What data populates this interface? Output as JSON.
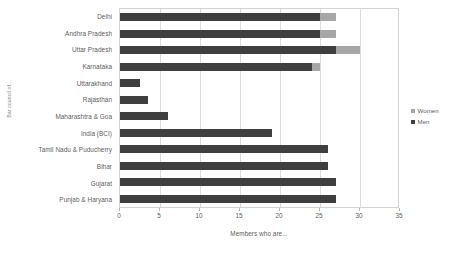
{
  "chart_data": {
    "type": "bar",
    "orientation": "horizontal",
    "stacked": true,
    "title": "",
    "xlabel": "Members who are...",
    "ylabel": "Bar council of...",
    "xlim": [
      0,
      35
    ],
    "xticks": [
      0,
      5,
      10,
      15,
      20,
      25,
      30,
      35
    ],
    "grid": true,
    "legend_position": "right",
    "categories": [
      "Delhi",
      "Andhra Pradesh",
      "Uttar Pradesh",
      "Karnataka",
      "Uttarakhand",
      "Rajasthan",
      "Maharashtra & Goa",
      "India (BCI)",
      "Tamil Nadu & Puducherry",
      "Bihar",
      "Gujarat",
      "Punjab & Haryana"
    ],
    "series": [
      {
        "name": "Men",
        "color": "#3f3f3f",
        "values": [
          25,
          25,
          27,
          24,
          2.5,
          3.5,
          6,
          19,
          26,
          26,
          27,
          27
        ]
      },
      {
        "name": "Women",
        "color": "#a6a6a6",
        "values": [
          2,
          2,
          3,
          1,
          0,
          0,
          0,
          0,
          0,
          0,
          0,
          0
        ]
      }
    ],
    "totals": [
      27,
      27,
      30,
      25,
      2.5,
      3.5,
      6,
      19,
      26,
      26,
      27,
      27
    ]
  },
  "legend": {
    "items": [
      {
        "label": "Women",
        "color": "#a6a6a6"
      },
      {
        "label": "Men",
        "color": "#3f3f3f"
      }
    ]
  },
  "colors": {
    "men": "#3f3f3f",
    "women": "#a6a6a6",
    "gridline": "#dcdcdc",
    "axis": "#d2d2d2",
    "text": "#5d5d5d",
    "background": "#ffffff"
  }
}
